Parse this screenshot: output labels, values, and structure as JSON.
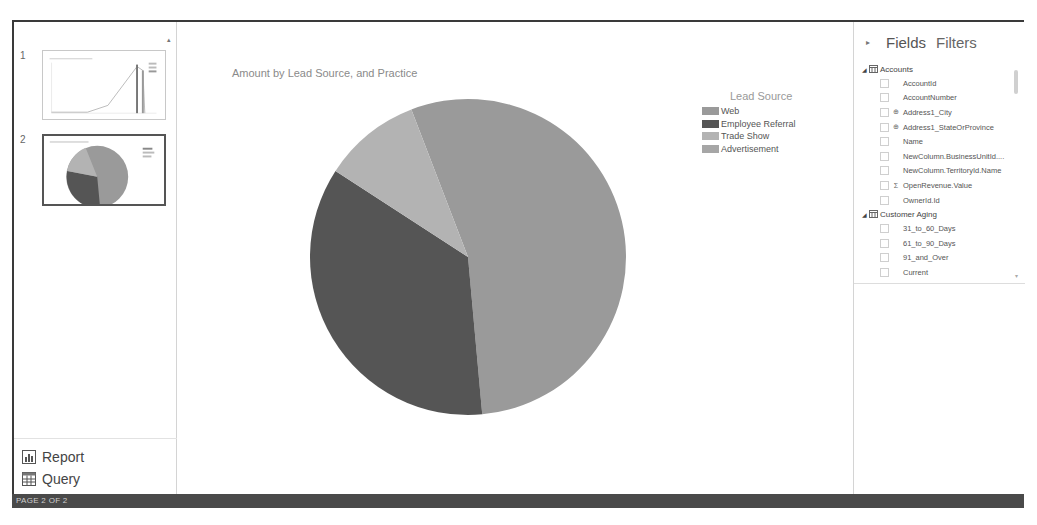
{
  "status_bar": {
    "text": "PAGE 2 OF 2"
  },
  "pages": [
    {
      "number": "1",
      "selected": false,
      "thumbnail": "line-and-bar-chart"
    },
    {
      "number": "2",
      "selected": true,
      "thumbnail": "pie-chart"
    }
  ],
  "nav": {
    "report_label": "Report",
    "query_label": "Query"
  },
  "chart_title": "Amount by Lead Source, and Practice",
  "legend": {
    "title": "Lead Source",
    "items": [
      {
        "label": "Web",
        "color": "#9a9a9a"
      },
      {
        "label": "Employee Referral",
        "color": "#555555"
      },
      {
        "label": "Trade Show",
        "color": "#b3b3b3"
      },
      {
        "label": "Advertisement",
        "color": "#a6a6a6"
      }
    ]
  },
  "chart_data": {
    "type": "pie",
    "title": "Amount by Lead Source, and Practice",
    "legend_title": "Lead Source",
    "legend_position": "right",
    "categories": [
      "Web",
      "Employee Referral",
      "Trade Show",
      "Advertisement"
    ],
    "values": [
      54.4,
      35.6,
      10.0,
      0
    ],
    "unit": "percent (estimated from slice angles)",
    "start_angle_deg": 339,
    "colors": [
      "#9a9a9a",
      "#555555",
      "#b3b3b3",
      "#a6a6a6"
    ]
  },
  "fields_pane": {
    "tabs": [
      "Fields",
      "Filters"
    ],
    "tables": [
      {
        "name": "Accounts",
        "expanded": true,
        "fields": [
          {
            "name": "AccountId",
            "glyph": ""
          },
          {
            "name": "AccountNumber",
            "glyph": ""
          },
          {
            "name": "Address1_City",
            "glyph": "globe"
          },
          {
            "name": "Address1_StateOrProvince",
            "glyph": "globe"
          },
          {
            "name": "Name",
            "glyph": ""
          },
          {
            "name": "NewColumn.BusinessUnitId....",
            "glyph": ""
          },
          {
            "name": "NewColumn.TerritoryId.Name",
            "glyph": ""
          },
          {
            "name": "OpenRevenue.Value",
            "glyph": "sigma"
          },
          {
            "name": "OwnerId.Id",
            "glyph": ""
          }
        ]
      },
      {
        "name": "Customer Aging",
        "expanded": true,
        "fields": [
          {
            "name": "31_to_60_Days",
            "glyph": ""
          },
          {
            "name": "61_to_90_Days",
            "glyph": ""
          },
          {
            "name": "91_and_Over",
            "glyph": ""
          },
          {
            "name": "Current",
            "glyph": ""
          }
        ]
      }
    ]
  }
}
